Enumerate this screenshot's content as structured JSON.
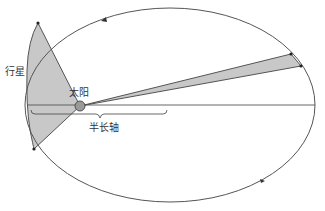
{
  "diagram": {
    "labels": {
      "planet": "行星",
      "sun": "太阳",
      "semi_major_axis": "半长轴"
    },
    "colors": {
      "orbit": "#555555",
      "sector_fill": "#c8c8c8",
      "sun_fill": "#9a9a9a",
      "line": "#444444"
    }
  }
}
